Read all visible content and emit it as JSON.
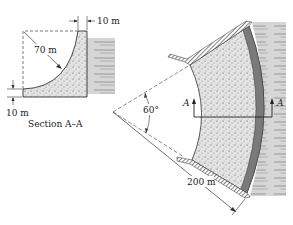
{
  "section": {
    "title": "Section A–A",
    "top_width_label": "10 m",
    "radius_label": "70 m",
    "base_height_label": "10 m"
  },
  "plan": {
    "angle_label": "60°",
    "radius_label": "200 m",
    "section_marker_left": "A",
    "section_marker_right": "A"
  },
  "colors": {
    "concrete": "#d9d9d9",
    "water": "#cfcfcf",
    "line": "#333333"
  }
}
